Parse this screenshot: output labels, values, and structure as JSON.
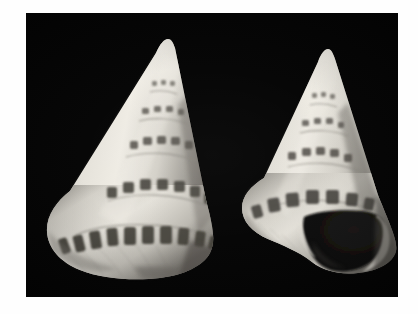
{
  "image": {
    "kind": "photograph",
    "subject": "two marine gastropod shells",
    "view_count": 2,
    "background_color": "#040404",
    "mount_color": "#fefefe",
    "shell_color": "#d8d5cd",
    "spot_color": "#4a4740",
    "aperture_color": "#0d0d0c",
    "width": 418,
    "height": 314
  },
  "photo_field": {
    "left": 26,
    "top": 13,
    "width": 372,
    "height": 284
  },
  "specimens": [
    {
      "id": "left-specimen",
      "label": "apertural-side-hidden view",
      "apex_x": 142,
      "apex_y": 42,
      "base_y": 250,
      "left_edge": 44,
      "right_edge": 207,
      "spiral_rows": 6,
      "aperture_visible": false
    },
    {
      "id": "right-specimen",
      "label": "apertural view",
      "apex_x": 300,
      "apex_y": 53,
      "base_y": 255,
      "left_edge": 232,
      "right_edge": 377,
      "spiral_rows": 6,
      "aperture_visible": true
    }
  ]
}
